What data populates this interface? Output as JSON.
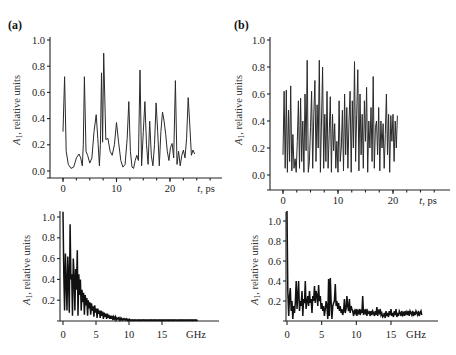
{
  "figure": {
    "panels": [
      {
        "id": "a",
        "label": "(a)"
      },
      {
        "id": "b",
        "label": "(b)"
      }
    ]
  },
  "chart_data": [
    {
      "panel": "(a) top",
      "type": "line",
      "title": "",
      "xlabel": "t, ps",
      "ylabel": "A1, relative units",
      "ylabel_main": "A",
      "ylabel_sub": "1",
      "ylabel_rest": ", relative units",
      "xlim": [
        -1,
        26
      ],
      "ylim": [
        0,
        1.0
      ],
      "xticks": [
        0,
        10,
        20
      ],
      "yticks": [
        0.0,
        0.2,
        0.4,
        0.6,
        0.8,
        1.0
      ],
      "ytick_labels": [
        "0.0",
        "0.2",
        "0.4",
        "0.6",
        "0.8",
        "1.0"
      ],
      "xtick_labels": [
        "0",
        "10",
        "20"
      ],
      "x": [
        0.0,
        0.3,
        0.6,
        1.0,
        1.5,
        2.0,
        2.5,
        3.0,
        3.3,
        3.6,
        3.8,
        4.0,
        4.3,
        4.6,
        5.0,
        5.4,
        5.8,
        6.2,
        6.5,
        6.8,
        7.0,
        7.2,
        7.4,
        7.6,
        8.0,
        8.4,
        8.8,
        9.2,
        9.6,
        10.0,
        10.4,
        10.8,
        11.2,
        11.6,
        12.0,
        12.3,
        12.6,
        12.9,
        13.2,
        13.5,
        13.8,
        14.1,
        14.4,
        14.7,
        15.0,
        15.3,
        15.6,
        15.9,
        16.2,
        16.5,
        16.8,
        17.1,
        17.4,
        17.7,
        18.0,
        18.3,
        18.6,
        18.9,
        19.2,
        19.5,
        19.8,
        20.1,
        20.4,
        20.7,
        21.0,
        21.3,
        21.6,
        21.9,
        22.2,
        22.5,
        22.8,
        23.1,
        23.4,
        23.7,
        24.0,
        24.3,
        24.6
      ],
      "values": [
        0.3,
        0.72,
        0.15,
        0.05,
        0.02,
        0.03,
        0.1,
        0.13,
        0.1,
        0.04,
        0.2,
        0.72,
        0.15,
        0.12,
        0.06,
        0.1,
        0.3,
        0.43,
        0.25,
        0.04,
        0.2,
        0.75,
        0.22,
        0.9,
        0.24,
        0.25,
        0.15,
        0.12,
        0.2,
        0.37,
        0.22,
        0.08,
        0.03,
        0.05,
        0.25,
        0.53,
        0.15,
        0.03,
        0.02,
        0.08,
        0.12,
        0.08,
        0.77,
        0.04,
        0.3,
        0.53,
        0.2,
        0.05,
        0.38,
        0.12,
        0.04,
        0.2,
        0.52,
        0.3,
        0.04,
        0.3,
        0.45,
        0.38,
        0.28,
        0.15,
        0.08,
        0.18,
        0.21,
        0.1,
        0.69,
        0.05,
        0.15,
        0.04,
        0.12,
        0.16,
        0.1,
        0.25,
        0.56,
        0.35,
        0.12,
        0.16,
        0.13
      ]
    },
    {
      "panel": "(b) top",
      "type": "line",
      "title": "",
      "xlabel": "t, ps",
      "ylabel": "A1, relative units",
      "ylabel_main": "A",
      "ylabel_sub": "1",
      "ylabel_rest": ", relative units",
      "xlim": [
        -1,
        26
      ],
      "ylim": [
        0,
        1.0
      ],
      "xticks": [
        0,
        10,
        20
      ],
      "yticks": [
        0.0,
        0.2,
        0.4,
        0.6,
        0.8,
        1.0
      ],
      "ytick_labels": [
        "0.0",
        "0.2",
        "0.4",
        "0.6",
        "0.8",
        "1.0"
      ],
      "xtick_labels": [
        "0",
        "10",
        "20"
      ],
      "x_step": 0.2,
      "values": [
        0.15,
        0.62,
        0.05,
        0.63,
        0.02,
        0.48,
        0.1,
        0.66,
        0.03,
        0.3,
        0.05,
        0.12,
        0.02,
        0.25,
        0.55,
        0.05,
        0.57,
        0.1,
        0.4,
        0.02,
        0.6,
        0.18,
        0.85,
        0.02,
        0.1,
        0.35,
        0.62,
        0.05,
        0.45,
        0.7,
        0.1,
        0.52,
        0.2,
        0.85,
        0.02,
        0.4,
        0.8,
        0.05,
        0.45,
        0.1,
        0.62,
        0.05,
        0.3,
        0.58,
        0.02,
        0.45,
        0.18,
        0.38,
        0.05,
        0.25,
        0.02,
        0.55,
        0.1,
        0.2,
        0.48,
        0.03,
        0.6,
        0.15,
        0.5,
        0.05,
        0.4,
        0.62,
        0.02,
        0.55,
        0.2,
        0.84,
        0.1,
        0.45,
        0.78,
        0.03,
        0.6,
        0.15,
        0.45,
        0.05,
        0.55,
        0.25,
        0.65,
        0.02,
        0.4,
        0.2,
        0.5,
        0.1,
        0.73,
        0.05,
        0.35,
        0.4,
        0.15,
        0.5,
        0.03,
        0.4,
        0.2,
        0.38,
        0.05,
        0.3,
        0.6,
        0.15,
        0.45,
        0.02,
        0.44,
        0.25,
        0.45,
        0.1,
        0.4,
        0.2,
        0.44
      ]
    },
    {
      "panel": "(a) bottom",
      "type": "line",
      "title": "",
      "xlabel": "GHz",
      "ylabel": "A1, relative units",
      "ylabel_main": "A",
      "ylabel_sub": "1",
      "ylabel_rest": ", relative units",
      "xlim": [
        0,
        22
      ],
      "ylim": [
        0,
        1.05
      ],
      "xticks": [
        0,
        5,
        10,
        15
      ],
      "xtick_labels": [
        "0",
        "5",
        "10",
        "15"
      ],
      "yticks": [
        0.2,
        0.4,
        0.6,
        0.8,
        1.0
      ],
      "ytick_labels": [
        "0.2",
        "0.4",
        "0.6",
        "0.8",
        "1.0"
      ],
      "x_step": 0.12,
      "values": [
        1.05,
        0.45,
        0.1,
        0.65,
        0.38,
        0.1,
        0.62,
        0.42,
        0.08,
        0.93,
        0.4,
        0.45,
        0.05,
        0.6,
        0.44,
        0.1,
        0.5,
        0.3,
        0.68,
        0.05,
        0.45,
        0.25,
        0.4,
        0.1,
        0.3,
        0.18,
        0.27,
        0.06,
        0.25,
        0.15,
        0.22,
        0.05,
        0.2,
        0.12,
        0.18,
        0.06,
        0.17,
        0.1,
        0.14,
        0.04,
        0.15,
        0.08,
        0.12,
        0.03,
        0.12,
        0.07,
        0.1,
        0.03,
        0.1,
        0.05,
        0.09,
        0.02,
        0.08,
        0.04,
        0.07,
        0.02,
        0.07,
        0.03,
        0.06,
        0.02,
        0.05,
        0.02,
        0.05,
        0.01,
        0.04,
        0.02,
        0.04,
        0.01,
        0.03,
        0.02,
        0.03,
        0.01,
        0.03,
        0.01,
        0.025,
        0.01,
        0.02,
        0.01,
        0.02,
        0.01,
        0.02,
        0.005,
        0.015,
        0.005,
        0.015,
        0.005,
        0.01,
        0.005,
        0.01,
        0.005,
        0.01,
        0.005,
        0.01,
        0.005,
        0.01,
        0.005,
        0.01,
        0.005,
        0.01,
        0.005,
        0.01,
        0.005,
        0.01,
        0.005,
        0.01,
        0.005,
        0.01,
        0.005,
        0.01,
        0.005,
        0.01,
        0.005,
        0.01,
        0.005,
        0.01,
        0.005,
        0.01,
        0.005,
        0.01,
        0.005,
        0.01,
        0.005,
        0.01,
        0.005,
        0.01,
        0.005,
        0.01,
        0.005,
        0.01,
        0.005,
        0.01,
        0.005,
        0.01,
        0.005,
        0.01,
        0.005,
        0.01,
        0.005,
        0.01,
        0.005,
        0.01,
        0.005,
        0.01,
        0.005,
        0.01,
        0.005,
        0.01,
        0.005,
        0.01,
        0.005,
        0.01,
        0.005,
        0.01,
        0.005,
        0.01,
        0.005,
        0.01,
        0.005,
        0.01,
        0.005,
        0.01,
        0.005,
        0.01,
        0.005,
        0.01,
        0.005,
        0.01,
        0.005,
        0.01,
        0.005,
        0.01
      ]
    },
    {
      "panel": "(b) bottom",
      "type": "line",
      "title": "",
      "xlabel": "GHz",
      "ylabel": "A1, relative units",
      "ylabel_main": "A",
      "ylabel_sub": "1",
      "ylabel_rest": ", relative units",
      "xlim": [
        0,
        21
      ],
      "ylim": [
        0,
        1.1
      ],
      "xticks": [
        0,
        5,
        10,
        15
      ],
      "xtick_labels": [
        "0",
        "5",
        "10",
        "15"
      ],
      "yticks": [
        0.2,
        0.4,
        0.6,
        0.8,
        1.0
      ],
      "ytick_labels": [
        "0.2",
        "0.4",
        "0.6",
        "0.8",
        "1.0"
      ],
      "x_step": 0.12,
      "values": [
        1.1,
        0.3,
        0.05,
        0.25,
        0.33,
        0.1,
        0.2,
        0.02,
        0.15,
        0.08,
        0.18,
        0.4,
        0.12,
        0.25,
        0.4,
        0.1,
        0.2,
        0.15,
        0.3,
        0.05,
        0.22,
        0.18,
        0.4,
        0.12,
        0.2,
        0.25,
        0.15,
        0.3,
        0.18,
        0.22,
        0.08,
        0.25,
        0.2,
        0.35,
        0.18,
        0.3,
        0.25,
        0.15,
        0.36,
        0.2,
        0.25,
        0.12,
        0.18,
        0.1,
        0.15,
        0.05,
        0.12,
        0.2,
        0.15,
        0.02,
        0.42,
        0.05,
        0.43,
        0.2,
        0.02,
        0.15,
        0.18,
        0.2,
        0.37,
        0.15,
        0.2,
        0.12,
        0.18,
        0.1,
        0.15,
        0.08,
        0.12,
        0.06,
        0.1,
        0.22,
        0.08,
        0.12,
        0.25,
        0.15,
        0.1,
        0.22,
        0.08,
        0.15,
        0.12,
        0.1,
        0.05,
        0.1,
        0.08,
        0.12,
        0.05,
        0.1,
        0.08,
        0.12,
        0.06,
        0.1,
        0.08,
        0.25,
        0.06,
        0.1,
        0.08,
        0.12,
        0.05,
        0.1,
        0.08,
        0.09,
        0.05,
        0.1,
        0.06,
        0.1,
        0.08,
        0.05,
        0.1,
        0.06,
        0.14,
        0.05,
        0.1,
        0.08,
        0.12,
        0.06,
        0.08,
        0.04,
        0.05,
        0.08,
        0.03,
        0.1,
        0.05,
        0.08,
        0.04,
        0.1,
        0.06,
        0.12,
        0.05,
        0.08,
        0.04,
        0.1,
        0.06,
        0.12,
        0.04,
        0.08,
        0.05,
        0.1,
        0.08,
        0.05,
        0.1,
        0.06,
        0.08,
        0.05,
        0.1,
        0.07,
        0.09,
        0.06,
        0.1,
        0.05,
        0.1,
        0.08,
        0.06,
        0.1,
        0.05,
        0.09,
        0.06,
        0.1,
        0.08,
        0.06,
        0.1,
        0.05,
        0.08,
        0.1,
        0.06
      ]
    }
  ]
}
